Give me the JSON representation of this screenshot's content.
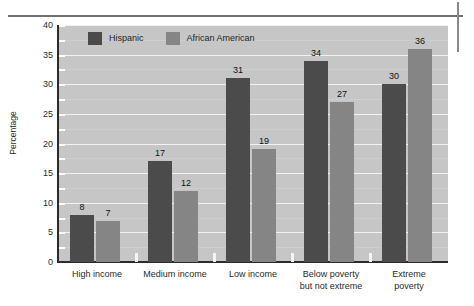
{
  "chart_data": {
    "type": "bar",
    "title": "",
    "subtitle": "",
    "xlabel": "",
    "ylabel": "Percentage",
    "ylim": [
      0,
      40
    ],
    "ytick_step": 5,
    "yminor_step": 2.5,
    "grid": true,
    "legend_position": "top-left-inside",
    "categories": [
      "High income",
      "Medium income",
      "Low income",
      "Below poverty but not extreme",
      "Extreme poverty"
    ],
    "category_lines": [
      [
        "High income"
      ],
      [
        "Medium income"
      ],
      [
        "Low income"
      ],
      [
        "Below poverty",
        "but not extreme"
      ],
      [
        "Extreme",
        "poverty"
      ]
    ],
    "yticks": [
      "0",
      "5",
      "10",
      "15",
      "20",
      "25",
      "30",
      "35",
      "40"
    ],
    "series": [
      {
        "name": "Hispanic",
        "color": "#4b4b4b",
        "values": [
          8,
          17,
          31,
          34,
          30
        ]
      },
      {
        "name": "African American",
        "color": "#858585",
        "values": [
          7,
          12,
          19,
          27,
          36
        ]
      }
    ],
    "value_labels": {
      "Hispanic": [
        "8",
        "17",
        "31",
        "34",
        "30"
      ],
      "African American": [
        "7",
        "12",
        "19",
        "27",
        "36"
      ]
    }
  },
  "style": {
    "plot_background": "#c6c6c6",
    "gridline_color": "#f2f2f2",
    "axis_color": "#2b2b2b",
    "page_background": "#ffffff",
    "crop_mark_color": "#6f6f6f"
  }
}
